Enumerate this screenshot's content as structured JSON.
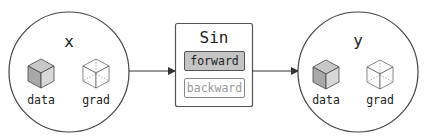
{
  "nodes": {
    "input": {
      "name": "x",
      "data_label": "data",
      "grad_label": "grad"
    },
    "function": {
      "name": "Sin",
      "forward_label": "forward",
      "backward_label": "backward"
    },
    "output": {
      "name": "y",
      "data_label": "data",
      "grad_label": "grad"
    }
  },
  "colors": {
    "stroke": "#444444",
    "data_cube_front": "#a8a8a8",
    "data_cube_top": "#c8c8c8",
    "data_cube_side": "#d8d8d8",
    "forward_fill": "#c4c4c4",
    "backward_text": "#999999"
  }
}
